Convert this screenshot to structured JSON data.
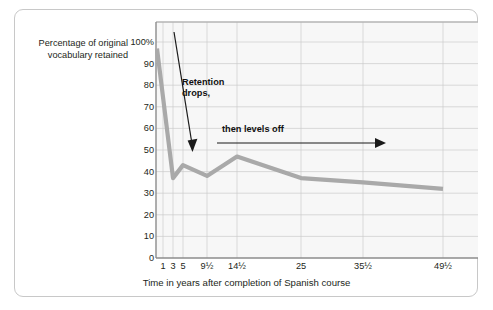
{
  "figure": {
    "y_axis_title": "Percentage of original vocabulary retained",
    "x_axis_title": "Time in years after completion of Spanish course",
    "annotations": [
      {
        "id": "retention-drops",
        "text_line1": "Retention",
        "text_line2": "drops,"
      },
      {
        "id": "then-levels-off",
        "text": "then levels off"
      }
    ],
    "colors": {
      "line": "#a9a9a9",
      "grid": "#c9c9c9",
      "axis": "#8c8c8c",
      "plot_background": "#f7f7f7",
      "text": "#231f20",
      "card_border": "#c8c8c8",
      "arrow": "#1a1a1a"
    }
  },
  "chart_data": {
    "type": "line",
    "title": "",
    "xlabel": "Time in years after completion of Spanish course",
    "ylabel": "Percentage of original vocabulary retained",
    "ylim": [
      0,
      100
    ],
    "yticks": [
      0,
      10,
      20,
      30,
      40,
      50,
      60,
      70,
      80,
      90,
      100
    ],
    "ytick_labels": [
      "0",
      "10",
      "20",
      "30",
      "40",
      "50",
      "60",
      "70",
      "80",
      "90",
      "100%"
    ],
    "xtick_values": [
      1,
      3,
      5,
      9.5,
      14.5,
      25,
      35.5,
      49.5
    ],
    "xtick_labels": [
      "1",
      "3",
      "5",
      "9½",
      "14½",
      "25",
      "35½",
      "49½"
    ],
    "grid": true,
    "legend": null,
    "series": [
      {
        "name": "Percentage of original vocabulary retained",
        "x": [
          1,
          3,
          5,
          9.5,
          14.5,
          25,
          35.5,
          49.5
        ],
        "values": [
          97,
          37,
          43,
          38,
          47,
          37,
          35,
          32
        ]
      }
    ],
    "annotations": [
      {
        "text": "Retention drops,",
        "arrow_from_xy": [
          2.0,
          106
        ],
        "arrow_to_xy": [
          5.2,
          50
        ]
      },
      {
        "text": "then levels off",
        "arrow_from_xy": [
          11.5,
          54
        ],
        "arrow_to_xy": [
          41.0,
          54
        ]
      }
    ]
  }
}
